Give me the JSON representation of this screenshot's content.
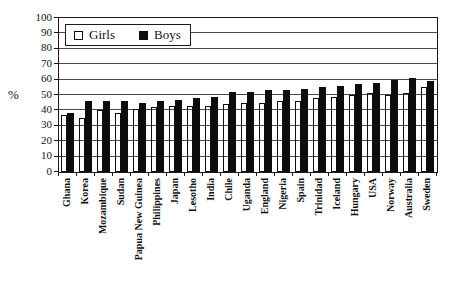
{
  "chart_data": {
    "type": "bar",
    "title": "",
    "xlabel": "",
    "ylabel": "%",
    "ylim": [
      0,
      100
    ],
    "yticks": [
      0,
      10,
      20,
      30,
      40,
      50,
      60,
      70,
      80,
      90,
      100
    ],
    "grid": true,
    "legend_position": "top-left",
    "categories": [
      "Ghana",
      "Korea",
      "Mozambique",
      "Sudan",
      "Papua New Guinea",
      "Philippines",
      "Japan",
      "Lesotho",
      "India",
      "Chile",
      "Uganda",
      "England",
      "Nigeria",
      "Spain",
      "Trinidad",
      "Iceland",
      "Hungary",
      "USA",
      "Norway",
      "Australia",
      "Sweden"
    ],
    "series": [
      {
        "name": "Girls",
        "fill": "#ffffff",
        "values": [
          37,
          35,
          40,
          38,
          41,
          42,
          43,
          43,
          43,
          44,
          45,
          45,
          46,
          46,
          48,
          49,
          50,
          51,
          50,
          51,
          55
        ]
      },
      {
        "name": "Boys",
        "fill": "#000000",
        "values": [
          38,
          46,
          46,
          46,
          45,
          46,
          47,
          48,
          49,
          52,
          52,
          53,
          53,
          54,
          55,
          56,
          57,
          58,
          60,
          61,
          59
        ]
      }
    ]
  },
  "colors": {
    "axis": "#1a1a1a",
    "gridline": "#4a4a4a",
    "background": "#ffffff"
  }
}
